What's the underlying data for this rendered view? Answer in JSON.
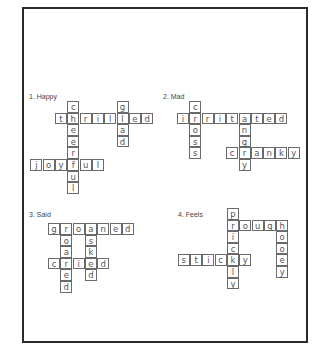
{
  "puzzles": [
    {
      "label": "1. Happy",
      "label_pos": [
        29,
        93
      ],
      "origin": [
        55,
        101
      ],
      "words": [
        {
          "word": "cheerful",
          "dir": "down",
          "col": 1,
          "row": 0
        },
        {
          "word": "thrilled",
          "dir": "across",
          "col": 0,
          "row": 1
        },
        {
          "word": "glad",
          "dir": "down",
          "col": 5,
          "row": 0
        },
        {
          "word": "joyful",
          "dir": "across",
          "col": -2,
          "row": 5
        }
      ]
    },
    {
      "label": "2. Mad",
      "label_pos": [
        163,
        93
      ],
      "origin": [
        177,
        101
      ],
      "words": [
        {
          "word": "cross",
          "dir": "down",
          "col": 1,
          "row": 0
        },
        {
          "word": "irritated",
          "dir": "across",
          "col": 0,
          "row": 1
        },
        {
          "word": "angry",
          "dir": "down",
          "col": 5,
          "row": 1
        },
        {
          "word": "cranky",
          "dir": "across",
          "col": 4,
          "row": 4
        }
      ]
    },
    {
      "label": "3. Said",
      "label_pos": [
        29,
        211
      ],
      "origin": [
        48,
        223
      ],
      "words": [
        {
          "word": "groaned",
          "dir": "across",
          "col": 0,
          "row": 0
        },
        {
          "word": "roared",
          "dir": "down",
          "col": 1,
          "row": 0
        },
        {
          "word": "asked",
          "dir": "down",
          "col": 3,
          "row": 0
        },
        {
          "word": "cried",
          "dir": "across",
          "col": 0,
          "row": 3
        }
      ]
    },
    {
      "label": "4. Feels",
      "label_pos": [
        178,
        211
      ],
      "origin": [
        227,
        208
      ],
      "words": [
        {
          "word": "prickly",
          "dir": "down",
          "col": 0,
          "row": 0
        },
        {
          "word": "rough",
          "dir": "across",
          "col": 0,
          "row": 1
        },
        {
          "word": "gooey",
          "dir": "down",
          "col": 4,
          "row": 1
        },
        {
          "word": "sticky",
          "dir": "across",
          "col": -4,
          "row": 4
        }
      ]
    }
  ]
}
